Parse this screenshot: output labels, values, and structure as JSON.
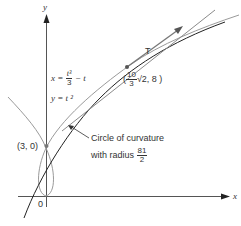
{
  "axes": {
    "x_label": "x",
    "y_label": "y",
    "origin_label": "0"
  },
  "curve": {
    "x_eq_lhs": "x =",
    "x_eq_num": "t³",
    "x_eq_den": "3",
    "x_eq_tail": "− t",
    "y_eq": "y = t ²"
  },
  "points": {
    "intercept": "(3, 0)",
    "tangent_point_open": "(",
    "tangent_point_num": "10",
    "tangent_point_den": "3",
    "tangent_point_sqrt": "√2, 8 )"
  },
  "tangent": {
    "label": "T"
  },
  "circle": {
    "line1": "Circle of curvature",
    "line2": "with radius",
    "radius_num": "81",
    "radius_den": "2"
  },
  "colors": {
    "curve": "#999999",
    "axis": "#444444",
    "circle": "#222222",
    "tangent": "#888888"
  }
}
